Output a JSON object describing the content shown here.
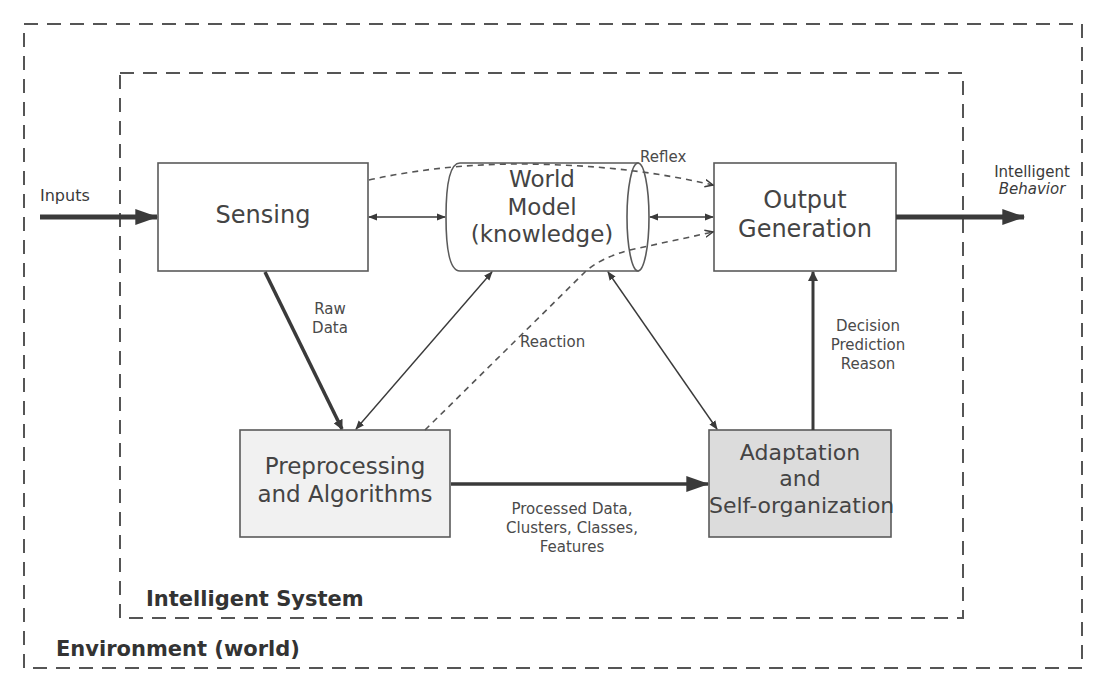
{
  "colors": {
    "line": "#3a3a3a",
    "box_border": "#5a5a5a",
    "adaptation_fill": "#dcdcdc",
    "preprocessing_fill": "#f1f1f1",
    "background": "#ffffff"
  },
  "regions": {
    "environment": {
      "label": "Environment (world)"
    },
    "intelligent_system": {
      "label": "Intelligent System"
    }
  },
  "nodes": {
    "sensing": {
      "label": "Sensing"
    },
    "world_model": {
      "line1": "World",
      "line2": "Model",
      "line3": "(knowledge)"
    },
    "output_generation": {
      "line1": "Output",
      "line2": "Generation"
    },
    "preprocessing": {
      "line1": "Preprocessing",
      "line2": "and Algorithms"
    },
    "adaptation": {
      "line1": "Adaptation",
      "line2": "and",
      "line3": "Self-organization"
    }
  },
  "edges": {
    "inputs": {
      "label": "Inputs"
    },
    "intelligent_behavior": {
      "line1": "Intelligent",
      "line2": "Behavior"
    },
    "reflex": {
      "label": "Reflex"
    },
    "raw_data": {
      "line1": "Raw",
      "line2": "Data"
    },
    "reaction": {
      "label": "Reaction"
    },
    "processed": {
      "line1": "Processed Data,",
      "line2": "Clusters, Classes,",
      "line3": "Features"
    },
    "decision": {
      "line1": "Decision",
      "line2": "Prediction",
      "line3": "Reason"
    }
  }
}
